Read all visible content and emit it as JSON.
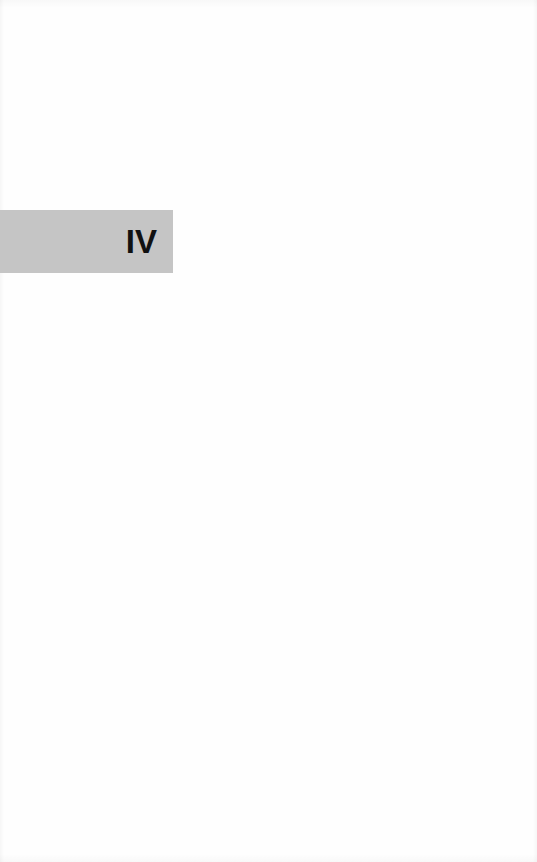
{
  "page": {
    "background_color": "#fefefe"
  },
  "section_tab": {
    "numeral": "IV",
    "background_color": "#c5c5c5",
    "text_color": "#111111"
  }
}
